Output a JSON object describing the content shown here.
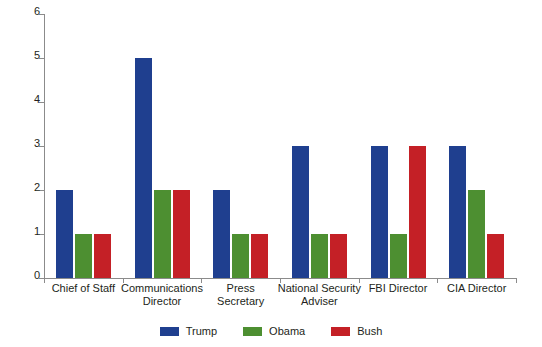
{
  "chart_data": {
    "type": "bar",
    "title": "",
    "subtitle": "",
    "xlabel": "",
    "ylabel": "",
    "ylim": [
      0,
      6
    ],
    "ytick_labels": [
      "0",
      "1",
      "2",
      "3",
      "4",
      "5",
      "6"
    ],
    "yticks": [
      0,
      1,
      2,
      3,
      4,
      5,
      6
    ],
    "grid": false,
    "legend_position": "bottom-center",
    "categories": [
      "Chief of Staff",
      "Communications Director",
      "Press Secretary",
      "National Security Adviser",
      "FBI Director",
      "CIA Director"
    ],
    "category_lines": [
      [
        "Chief of Staff"
      ],
      [
        "Communications",
        "Director"
      ],
      [
        "Press",
        "Secretary"
      ],
      [
        "National Security",
        "Adviser"
      ],
      [
        "FBI Director"
      ],
      [
        "CIA Director"
      ]
    ],
    "series": [
      {
        "name": "Trump",
        "color": "#1f3f8f",
        "values": [
          2,
          5,
          2,
          3,
          3,
          3
        ]
      },
      {
        "name": "Obama",
        "color": "#4d8f31",
        "values": [
          1,
          2,
          1,
          1,
          1,
          2
        ]
      },
      {
        "name": "Bush",
        "color": "#c42026",
        "values": [
          1,
          2,
          1,
          1,
          3,
          1
        ]
      }
    ]
  },
  "legend": {
    "items": [
      {
        "label": "Trump",
        "color": "#1f3f8f"
      },
      {
        "label": "Obama",
        "color": "#4d8f31"
      },
      {
        "label": "Bush",
        "color": "#c42026"
      }
    ]
  },
  "axis": {
    "line_color": "#8b8b8b"
  }
}
